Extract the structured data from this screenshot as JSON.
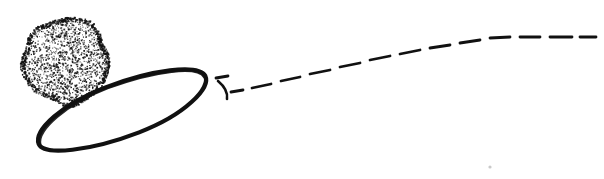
{
  "canvas": {
    "width": 604,
    "height": 179,
    "background_color": "#ffffff",
    "ink_color": "#111111",
    "title": "Hand-drawn sketch: stippled sphere with tilted ring and dashed trajectory"
  },
  "figure": {
    "style": "hand-drawn pen-and-ink line art",
    "elements": [
      {
        "id": "stippled-blob",
        "label": "stippled sphere",
        "shape": "irregular circle filled with random ink dots",
        "center": [
          66,
          61
        ],
        "radius_x": 44,
        "radius_y": 44,
        "bounds": [
          22,
          18,
          110,
          105
        ],
        "fill": "stipple",
        "stroke_color": "#111111",
        "dot_count": 1500,
        "dot_size": 1.1
      },
      {
        "id": "tilted-ellipse",
        "label": "tilted ring",
        "shape": "thick open ellipse outline",
        "center": [
          122,
          110
        ],
        "radius_x": 90,
        "radius_y": 27,
        "rotation_deg": -21,
        "stroke_width": 4.2,
        "stroke_color": "#111111",
        "fill": "none"
      },
      {
        "id": "hook-mark",
        "label": "small curved hook tick",
        "shape": "short curved stroke",
        "bounds": [
          216,
          80,
          232,
          99
        ],
        "stroke_width": 2.6,
        "stroke_color": "#111111"
      },
      {
        "id": "dashed-trajectory",
        "label": "dashed trajectory arc",
        "shape": "dashed curve rising left-to-right and flattening",
        "stroke_width": 2.8,
        "stroke_color": "#111111",
        "start": [
          216,
          78
        ],
        "end": [
          590,
          38
        ],
        "direction": "upward to the right, curvature decreasing"
      },
      {
        "id": "stray-speck",
        "label": "stray ink speck",
        "shape": "dot",
        "position": [
          490,
          167
        ],
        "size": 1.6,
        "color": "#c9c9c9"
      }
    ]
  },
  "dashes": [
    {
      "x1": 216,
      "y1": 78,
      "x2": 228,
      "y2": 76
    },
    {
      "x1": 231,
      "y1": 92,
      "x2": 243,
      "y2": 90
    },
    {
      "x1": 252,
      "y1": 88,
      "x2": 271,
      "y2": 84
    },
    {
      "x1": 281,
      "y1": 81,
      "x2": 300,
      "y2": 77
    },
    {
      "x1": 310,
      "y1": 74,
      "x2": 330,
      "y2": 70
    },
    {
      "x1": 340,
      "y1": 67,
      "x2": 360,
      "y2": 63
    },
    {
      "x1": 370,
      "y1": 60,
      "x2": 390,
      "y2": 56
    },
    {
      "x1": 400,
      "y1": 54,
      "x2": 420,
      "y2": 50
    },
    {
      "x1": 430,
      "y1": 48,
      "x2": 450,
      "y2": 45
    },
    {
      "x1": 460,
      "y1": 43,
      "x2": 480,
      "y2": 40
    },
    {
      "x1": 490,
      "y1": 38,
      "x2": 510,
      "y2": 37
    },
    {
      "x1": 520,
      "y1": 37,
      "x2": 540,
      "y2": 37
    },
    {
      "x1": 550,
      "y1": 37,
      "x2": 572,
      "y2": 37
    },
    {
      "x1": 580,
      "y1": 37,
      "x2": 596,
      "y2": 37
    }
  ]
}
